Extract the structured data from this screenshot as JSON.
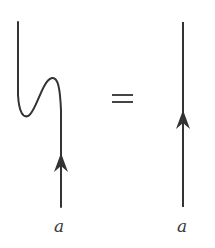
{
  "diagram": {
    "type": "string-diagram-identity",
    "relation": "=",
    "left": {
      "description": "wiggly strand with upward arrow",
      "label": "a",
      "arrow_direction": "up"
    },
    "right": {
      "description": "straight vertical strand with upward arrow",
      "label": "a",
      "arrow_direction": "up"
    },
    "stroke_color": "#333333"
  }
}
